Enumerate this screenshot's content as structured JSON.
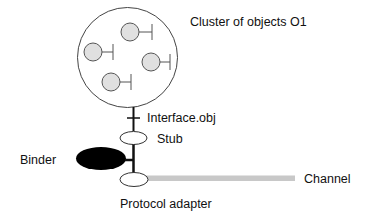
{
  "diagram": {
    "cluster": {
      "label": "Cluster of objects O1",
      "object_count": 4
    },
    "interface_label": "Interface.obj",
    "stub_label": "Stub",
    "binder_label": "Binder",
    "channel_label": "Channel",
    "adapter_label": "Protocol adapter",
    "colors": {
      "object_fill": "#e0e0e0",
      "binder_fill": "#000000",
      "channel": "#c8c8c8",
      "stroke": "#333333"
    }
  }
}
